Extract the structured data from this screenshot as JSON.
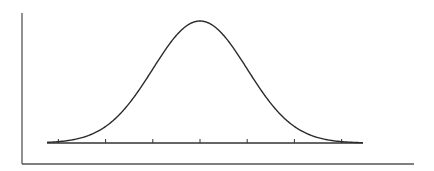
{
  "chart_data": {
    "type": "line",
    "title": "",
    "xlabel": "",
    "ylabel": "",
    "x": [
      -3,
      -2,
      -1,
      0,
      1,
      2,
      3
    ],
    "tick_labels": [
      "",
      "",
      "",
      "",
      "",
      "",
      ""
    ],
    "series": [
      {
        "name": "normal-curve",
        "mean": 0,
        "sd": 1
      }
    ],
    "xlim": [
      -3.25,
      3.5
    ],
    "grid": false,
    "legend": "none"
  },
  "colors": {
    "curve": "#2a2a2a",
    "axis": "#555555",
    "baseline": "#333333"
  }
}
